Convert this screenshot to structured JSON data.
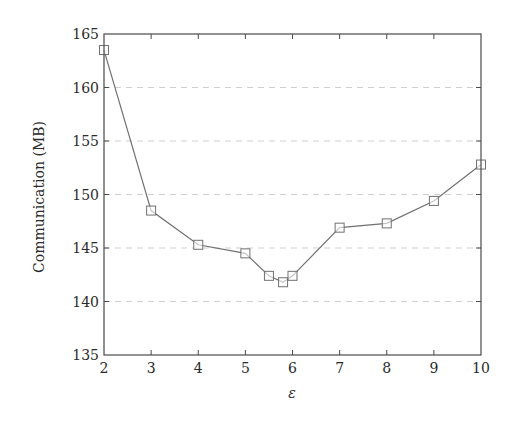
{
  "chart_data": {
    "type": "line",
    "title": "",
    "xlabel": "ε",
    "ylabel": "Communication (MB)",
    "xlim": [
      2,
      10
    ],
    "ylim": [
      135,
      165
    ],
    "xticks": [
      2,
      3,
      4,
      5,
      6,
      7,
      8,
      9,
      10
    ],
    "yticks": [
      135,
      140,
      145,
      150,
      155,
      160,
      165
    ],
    "grid": {
      "y": true,
      "x": false,
      "style": "dashed"
    },
    "legend": null,
    "series": [
      {
        "name": "Communication",
        "marker": "square",
        "color": "#707070",
        "x": [
          2,
          3,
          4,
          5,
          5.5,
          5.8,
          6,
          7,
          8,
          9,
          10
        ],
        "y": [
          163.5,
          148.5,
          145.3,
          144.5,
          142.4,
          141.8,
          142.4,
          146.9,
          147.3,
          149.4,
          152.8
        ]
      }
    ]
  },
  "labels": {
    "ylabel": "Communication (MB)",
    "xlabel": "ε"
  },
  "colors": {
    "axis": "#4a4a4a",
    "grid": "#cfcfcf",
    "line": "#707070"
  }
}
